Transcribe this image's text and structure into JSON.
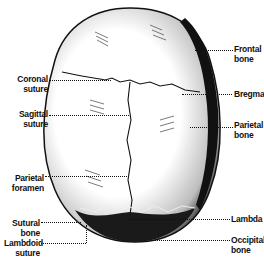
{
  "figure": {
    "labels_left": [
      {
        "line1": "Coronal",
        "line2": "suture"
      },
      {
        "line1": "Sagittal",
        "line2": "suture"
      },
      {
        "line1": "Parietal",
        "line2": "foramen"
      },
      {
        "line1": "Sutural",
        "line2": "bone"
      },
      {
        "line1": "Lambdoid",
        "line2": "suture"
      }
    ],
    "labels_right": [
      {
        "line1": "Frontal",
        "line2": "bone"
      },
      {
        "line1": "Bregma",
        "line2": ""
      },
      {
        "line1": "Parietal",
        "line2": "bone"
      },
      {
        "line1": "Lambda",
        "line2": ""
      },
      {
        "line1": "Occipital",
        "line2": "bone"
      }
    ]
  },
  "colors": {
    "ink": "#111111",
    "background": "#ffffff"
  }
}
